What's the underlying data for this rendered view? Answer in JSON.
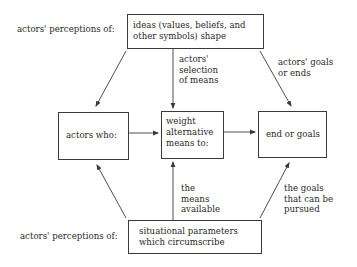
{
  "diagram": {
    "type": "flow-diagram",
    "nodes": {
      "ideas": {
        "text_line1": "ideas (values, beliefs, and",
        "text_line2": "other symbols) shape"
      },
      "actors": {
        "text": "actors  who:"
      },
      "weight": {
        "text_line1": "weight",
        "text_line2": "alternative",
        "text_line3": "means to:"
      },
      "ends": {
        "text": "end or goals"
      },
      "situational": {
        "text_line1": "situational parameters",
        "text_line2": "which circumscribe"
      }
    },
    "side_labels": {
      "top": "actors' perceptions of:",
      "bottom": "actors' perceptions of:"
    },
    "edge_labels": {
      "selection": {
        "line1": "actors'",
        "line2": "selection",
        "line3": "of means"
      },
      "goals_ends": {
        "line1": "actors' goals",
        "line2": "or ends"
      },
      "means_available": {
        "line1": "the",
        "line2": "means",
        "line3": "available"
      },
      "goals_pursued": {
        "line1": "the goals",
        "line2": "that can be",
        "line3": "pursued"
      }
    },
    "colors": {
      "line": "#3a3a3a",
      "text": "#2a2a2a",
      "background": "#ffffff"
    }
  }
}
